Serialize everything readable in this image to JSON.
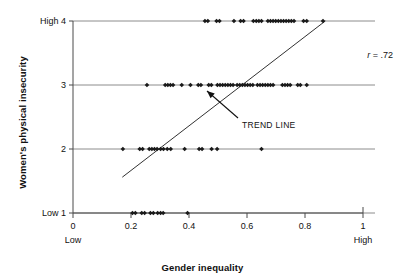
{
  "chart_data": {
    "type": "scatter",
    "title": "",
    "xlabel": "Gender inequality",
    "ylabel": "Women's physical insecurity",
    "xlim": [
      0,
      1
    ],
    "ylim": [
      1,
      4
    ],
    "grid": false,
    "horizontal_rules_at_y": [
      1,
      2,
      3,
      4
    ],
    "x_ticks": [
      "0",
      "0.2",
      "0.4",
      "0.6",
      "0.8",
      "1"
    ],
    "x_tick_values": [
      0,
      0.2,
      0.4,
      0.6,
      0.8,
      1
    ],
    "x_low_label": "Low",
    "x_high_label": "High",
    "y_ticks": [
      "Low 1",
      "2",
      "3",
      "High 4"
    ],
    "y_tick_values": [
      1,
      2,
      3,
      4
    ],
    "marker": "diamond",
    "marker_color": "#1a1a1a",
    "annotations": [
      {
        "name": "correlation",
        "text": "r = .72",
        "r_symbol": "r",
        "r_value": "= .72"
      },
      {
        "name": "trend-line-callout",
        "text": "TREND LINE"
      }
    ],
    "trend_line": {
      "x_start": 0.17,
      "y_start": 1.56,
      "x_end": 0.87,
      "y_end": 4.0,
      "color": "#1a1a1a"
    },
    "points": [
      {
        "x": 0.455,
        "y": 4
      },
      {
        "x": 0.465,
        "y": 4
      },
      {
        "x": 0.495,
        "y": 4
      },
      {
        "x": 0.505,
        "y": 4
      },
      {
        "x": 0.555,
        "y": 4
      },
      {
        "x": 0.578,
        "y": 4
      },
      {
        "x": 0.588,
        "y": 4
      },
      {
        "x": 0.622,
        "y": 4
      },
      {
        "x": 0.632,
        "y": 4
      },
      {
        "x": 0.641,
        "y": 4
      },
      {
        "x": 0.65,
        "y": 4
      },
      {
        "x": 0.672,
        "y": 4
      },
      {
        "x": 0.681,
        "y": 4
      },
      {
        "x": 0.69,
        "y": 4
      },
      {
        "x": 0.699,
        "y": 4
      },
      {
        "x": 0.708,
        "y": 4
      },
      {
        "x": 0.717,
        "y": 4
      },
      {
        "x": 0.726,
        "y": 4
      },
      {
        "x": 0.735,
        "y": 4
      },
      {
        "x": 0.744,
        "y": 4
      },
      {
        "x": 0.753,
        "y": 4
      },
      {
        "x": 0.762,
        "y": 4
      },
      {
        "x": 0.795,
        "y": 4
      },
      {
        "x": 0.806,
        "y": 4
      },
      {
        "x": 0.862,
        "y": 4
      },
      {
        "x": 0.255,
        "y": 3
      },
      {
        "x": 0.318,
        "y": 3
      },
      {
        "x": 0.327,
        "y": 3
      },
      {
        "x": 0.336,
        "y": 3
      },
      {
        "x": 0.345,
        "y": 3
      },
      {
        "x": 0.375,
        "y": 3
      },
      {
        "x": 0.405,
        "y": 3
      },
      {
        "x": 0.432,
        "y": 3
      },
      {
        "x": 0.441,
        "y": 3
      },
      {
        "x": 0.468,
        "y": 3
      },
      {
        "x": 0.477,
        "y": 3
      },
      {
        "x": 0.498,
        "y": 3
      },
      {
        "x": 0.507,
        "y": 3
      },
      {
        "x": 0.516,
        "y": 3
      },
      {
        "x": 0.525,
        "y": 3
      },
      {
        "x": 0.534,
        "y": 3
      },
      {
        "x": 0.543,
        "y": 3
      },
      {
        "x": 0.552,
        "y": 3
      },
      {
        "x": 0.566,
        "y": 3
      },
      {
        "x": 0.575,
        "y": 3
      },
      {
        "x": 0.584,
        "y": 3
      },
      {
        "x": 0.593,
        "y": 3
      },
      {
        "x": 0.602,
        "y": 3
      },
      {
        "x": 0.611,
        "y": 3
      },
      {
        "x": 0.62,
        "y": 3
      },
      {
        "x": 0.636,
        "y": 3
      },
      {
        "x": 0.645,
        "y": 3
      },
      {
        "x": 0.654,
        "y": 3
      },
      {
        "x": 0.663,
        "y": 3
      },
      {
        "x": 0.672,
        "y": 3
      },
      {
        "x": 0.681,
        "y": 3
      },
      {
        "x": 0.69,
        "y": 3
      },
      {
        "x": 0.722,
        "y": 3
      },
      {
        "x": 0.731,
        "y": 3
      },
      {
        "x": 0.74,
        "y": 3
      },
      {
        "x": 0.749,
        "y": 3
      },
      {
        "x": 0.775,
        "y": 3
      },
      {
        "x": 0.784,
        "y": 3
      },
      {
        "x": 0.806,
        "y": 3
      },
      {
        "x": 0.172,
        "y": 2
      },
      {
        "x": 0.23,
        "y": 2
      },
      {
        "x": 0.24,
        "y": 2
      },
      {
        "x": 0.263,
        "y": 2
      },
      {
        "x": 0.272,
        "y": 2
      },
      {
        "x": 0.281,
        "y": 2
      },
      {
        "x": 0.29,
        "y": 2
      },
      {
        "x": 0.302,
        "y": 2
      },
      {
        "x": 0.312,
        "y": 2
      },
      {
        "x": 0.325,
        "y": 2
      },
      {
        "x": 0.337,
        "y": 2
      },
      {
        "x": 0.385,
        "y": 2
      },
      {
        "x": 0.435,
        "y": 2
      },
      {
        "x": 0.445,
        "y": 2
      },
      {
        "x": 0.478,
        "y": 2
      },
      {
        "x": 0.497,
        "y": 2
      },
      {
        "x": 0.65,
        "y": 2
      },
      {
        "x": 0.205,
        "y": 1
      },
      {
        "x": 0.215,
        "y": 1
      },
      {
        "x": 0.237,
        "y": 1
      },
      {
        "x": 0.247,
        "y": 1
      },
      {
        "x": 0.267,
        "y": 1
      },
      {
        "x": 0.277,
        "y": 1
      },
      {
        "x": 0.292,
        "y": 1
      },
      {
        "x": 0.302,
        "y": 1
      },
      {
        "x": 0.311,
        "y": 1
      },
      {
        "x": 0.395,
        "y": 1
      }
    ]
  },
  "axes": {
    "x_title": "Gender inequality",
    "y_title": "Women's physical insecurity",
    "x_low": "Low",
    "x_high": "High"
  }
}
